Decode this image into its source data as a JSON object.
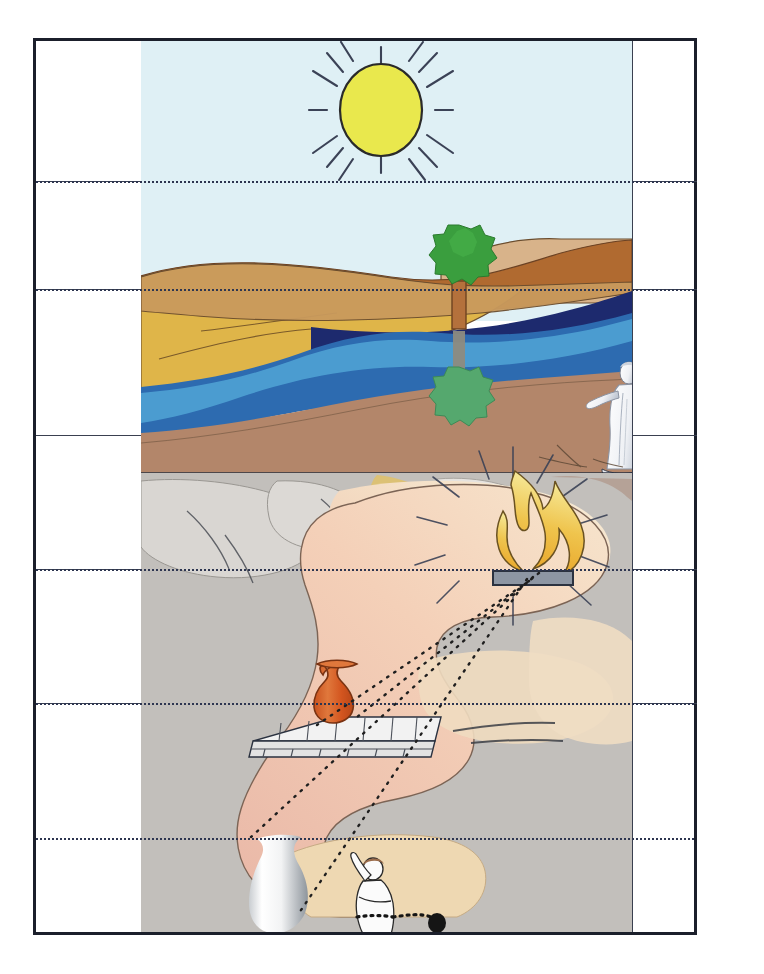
{
  "figure": {
    "caption": "",
    "background_color": "#ffffff",
    "frame_color": "#1b1f2b",
    "rule_color": "#3a4050",
    "dotted_level_color": "#2d3550"
  },
  "grid": {
    "columns": [
      {
        "name": "left-label-column",
        "label": "",
        "x": 0,
        "width": 105
      },
      {
        "name": "illustration-column",
        "label": "",
        "x": 105,
        "width": 491
      },
      {
        "name": "right-label-column",
        "label": "",
        "x": 596,
        "width": 65
      }
    ],
    "rows": [
      {
        "name": "row-sun",
        "label": "",
        "y": 0,
        "height": 140
      },
      {
        "name": "row-sky",
        "label": "",
        "y": 140,
        "height": 108
      },
      {
        "name": "row-world",
        "label": "",
        "y": 248,
        "height": 146
      },
      {
        "name": "row-firelight",
        "label": "",
        "y": 394,
        "height": 134
      },
      {
        "name": "row-objects",
        "label": "",
        "y": 528,
        "height": 134
      },
      {
        "name": "row-shadows",
        "label": "",
        "y": 662,
        "height": 229
      }
    ],
    "row_rule_offsets": [
      140,
      248,
      394,
      528,
      662
    ],
    "level_line_offsets": [
      140,
      248,
      528,
      662,
      797
    ]
  },
  "scene": {
    "upper_world": {
      "name": "visible-world-outside-cave",
      "sky_color": "#dff0f5",
      "sun": {
        "name": "sun",
        "label": "",
        "fill": "#e9e84d",
        "stroke": "#2a2a2a",
        "cx": 240,
        "cy": 69,
        "r": 41,
        "ray_count": 12,
        "ray_color": "#3b4256"
      },
      "tree": {
        "name": "tree",
        "label": "",
        "crown_color": "#3a9e3e",
        "crown_shade": "#2e8434",
        "trunk_color": "#b4713c",
        "trunk_stroke": "#6e4320"
      },
      "tree_reflection": {
        "name": "tree-reflection",
        "label": "",
        "crown_color": "#55a86e",
        "trunk_color": "#8d8b7f"
      },
      "bands": [
        {
          "name": "hill-sand-far",
          "color": "#d8b38a"
        },
        {
          "name": "hill-ridge-brown",
          "color": "#b06a30"
        },
        {
          "name": "meadow-gold",
          "color": "#dfb549"
        },
        {
          "name": "shore-tan",
          "color": "#c99a5d"
        },
        {
          "name": "water-deep",
          "color": "#1d2a6e"
        },
        {
          "name": "water-mid",
          "color": "#2d6bb0"
        },
        {
          "name": "water-shallow",
          "color": "#4d9fd2"
        },
        {
          "name": "beach",
          "color": "#b3866a"
        }
      ],
      "philosopher": {
        "name": "philosopher-statue",
        "label": "",
        "robe_color": "#f4f5f7",
        "shade_color": "#b9c0cc"
      }
    },
    "cave": {
      "name": "cave-interior",
      "rock_color": "#bfbcb9",
      "rock_light": "#d6d3cf",
      "wall_color": "#f0ceba",
      "wall_warm": "#ecd9b4",
      "glow_color": "#f6e7c8",
      "fire": {
        "name": "fire",
        "label": "",
        "flame_top": "#f3e58a",
        "flame_bottom": "#e8a52a",
        "stroke": "#6a5221",
        "platform_color": "#8d96a3",
        "platform_stroke": "#2b3240",
        "ray_count": 12,
        "ray_color": "#3b4256"
      },
      "wall_and_vase": {
        "name": "parapet-wall",
        "label": "",
        "wall_color": "#e8e8e8",
        "wall_stroke": "#2b3240",
        "vase": {
          "name": "carried-vase",
          "label": "",
          "fill": "#d9642a",
          "highlight": "#e98b4a",
          "stroke": "#7a3312"
        }
      },
      "shadow_vase": {
        "name": "shadow-vase",
        "label": "",
        "light": "#ffffff",
        "dark": "#9aa0a6"
      },
      "prisoner": {
        "name": "chained-prisoner",
        "label": "",
        "body_color": "#fbfbfb",
        "outline": "#2a2a2a",
        "chain_color": "#151515"
      },
      "light_rays": {
        "name": "projection-rays",
        "label": "",
        "color": "#2a2a2a",
        "style": "dotted"
      }
    }
  }
}
